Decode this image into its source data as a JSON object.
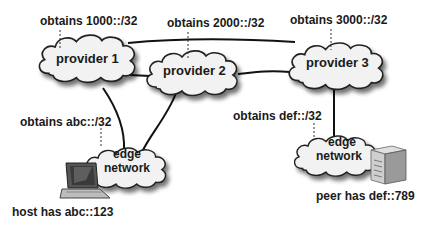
{
  "diagram": {
    "providers": [
      {
        "id": "p1",
        "label": "provider 1",
        "prefix_label": "obtains 1000::/32"
      },
      {
        "id": "p2",
        "label": "provider 2",
        "prefix_label": "obtains 2000::/32"
      },
      {
        "id": "p3",
        "label": "provider 3",
        "prefix_label": "obtains 3000::/32"
      }
    ],
    "edge_networks": [
      {
        "id": "e1",
        "label_line1": "edge",
        "label_line2": "network",
        "prefix_label": "obtains abc::/32"
      },
      {
        "id": "e2",
        "label_line1": "edge",
        "label_line2": "network",
        "prefix_label": "obtains def::/32"
      }
    ],
    "hosts": [
      {
        "id": "host",
        "icon": "laptop-icon",
        "label": "host has abc::123"
      },
      {
        "id": "peer",
        "icon": "server-icon",
        "label": "peer has def::789"
      }
    ],
    "links": [
      {
        "from": "p1",
        "to": "p2"
      },
      {
        "from": "p1",
        "to": "p3"
      },
      {
        "from": "p2",
        "to": "p3"
      },
      {
        "from": "p1",
        "to": "e1"
      },
      {
        "from": "p2",
        "to": "e1"
      },
      {
        "from": "p3",
        "to": "e2"
      }
    ]
  }
}
